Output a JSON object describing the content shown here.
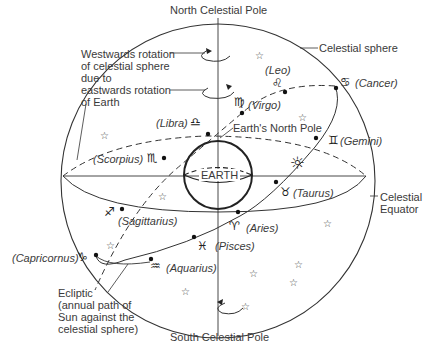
{
  "poles": {
    "north": "North Celestial Pole",
    "south": "South Celestial Pole"
  },
  "annotations": {
    "rotation_line1": "Westwards rotation",
    "rotation_line2": "of celestial sphere",
    "rotation_line3": "due to",
    "rotation_line4": "eastwards rotation",
    "rotation_line5": "of Earth",
    "celestial_sphere": "Celestial sphere",
    "earth_north_pole": "Earth's North Pole",
    "earth": "EARTH",
    "celestial_equator_line1": "Celestial",
    "celestial_equator_line2": "Equator",
    "ecliptic_line1": "Ecliptic",
    "ecliptic_line2": "(annual path of",
    "ecliptic_line3": "Sun against the",
    "ecliptic_line4": "celestial sphere)"
  },
  "zodiac": [
    {
      "name": "(Leo)",
      "symbol": "♌"
    },
    {
      "name": "(Cancer)",
      "symbol": "♋"
    },
    {
      "name": "(Virgo)",
      "symbol": "♍"
    },
    {
      "name": "(Libra)",
      "symbol": "♎"
    },
    {
      "name": "(Gemini)",
      "symbol": "♊"
    },
    {
      "name": "(Scorpius)",
      "symbol": "♏"
    },
    {
      "name": "(Taurus)",
      "symbol": "♉"
    },
    {
      "name": "(Sagittarius)",
      "symbol": "♐"
    },
    {
      "name": "(Aries)",
      "symbol": "♈"
    },
    {
      "name": "(Pisces)",
      "symbol": "♓"
    },
    {
      "name": "(Capricornus)",
      "symbol": "♑"
    },
    {
      "name": "(Aquarius)",
      "symbol": "♒"
    }
  ],
  "sun_symbol": "☼",
  "star_symbol": "☆",
  "colors": {
    "line": "#333333",
    "text": "#3a3a3a"
  }
}
